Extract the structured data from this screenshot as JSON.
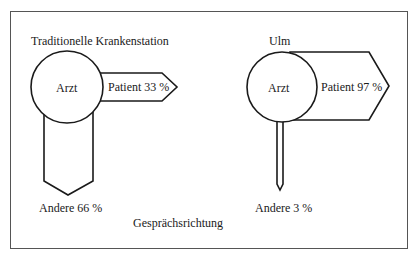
{
  "figure": {
    "caption": "Gesprächsrichtung",
    "stroke_color": "#1a1a1a",
    "frame_color": "#555555"
  },
  "panels": [
    {
      "title": "Traditionelle Krankenstation",
      "center_label": "Arzt",
      "right_arrow_label": "Patient 33 %",
      "down_arrow_label": "Andere 66 %",
      "patient_percent": 33,
      "andere_percent": 66
    },
    {
      "title": "Ulm",
      "center_label": "Arzt",
      "right_arrow_label": "Patient 97 %",
      "down_arrow_label": "Andere 3 %",
      "patient_percent": 97,
      "andere_percent": 3
    }
  ]
}
